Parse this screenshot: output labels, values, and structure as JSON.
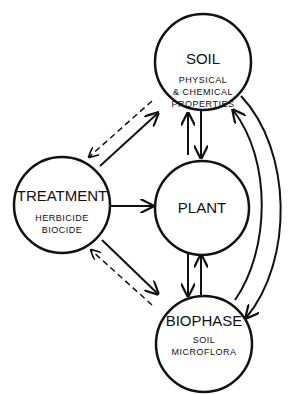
{
  "diagram": {
    "nodes": {
      "soil": {
        "title": "SOIL",
        "lines": [
          "PHYSICAL",
          "& CHEMICAL",
          "PROPERTIES"
        ]
      },
      "treatment": {
        "title": "TREATMENT",
        "lines": [
          "HERBICIDE",
          "BIOCIDE"
        ]
      },
      "plant": {
        "title": "PLANT",
        "lines": []
      },
      "biophase": {
        "title": "BIOPHASE",
        "lines": [
          "SOIL",
          "MICROFLORA"
        ]
      }
    },
    "edges": [
      {
        "from": "treatment",
        "to": "soil",
        "style": "solid"
      },
      {
        "from": "soil",
        "to": "treatment",
        "style": "dashed"
      },
      {
        "from": "treatment",
        "to": "biophase",
        "style": "solid"
      },
      {
        "from": "biophase",
        "to": "treatment",
        "style": "dashed"
      },
      {
        "from": "treatment",
        "to": "plant",
        "style": "solid"
      },
      {
        "from": "plant",
        "to": "soil",
        "style": "solid"
      },
      {
        "from": "soil",
        "to": "plant",
        "style": "solid"
      },
      {
        "from": "plant",
        "to": "biophase",
        "style": "solid"
      },
      {
        "from": "biophase",
        "to": "plant",
        "style": "solid"
      },
      {
        "from": "biophase",
        "to": "soil",
        "style": "solid-curved"
      },
      {
        "from": "soil",
        "to": "biophase",
        "style": "solid-curved"
      }
    ]
  }
}
